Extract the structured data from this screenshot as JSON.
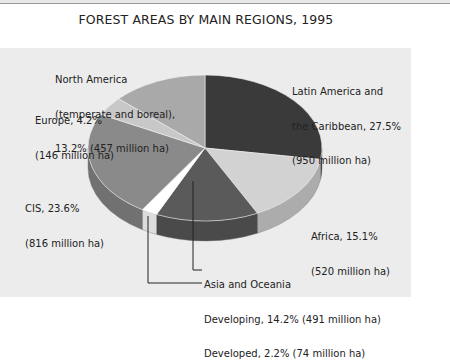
{
  "chart_data": {
    "type": "pie",
    "title": "FOREST AREAS BY MAIN REGIONS, 1995",
    "style": "3d-pie",
    "slices": [
      {
        "name": "Latin America and the Caribbean",
        "percent": 27.5,
        "value": 950,
        "unit": "million ha",
        "color": "#3a3a3a"
      },
      {
        "name": "Africa",
        "percent": 15.1,
        "value": 520,
        "unit": "million ha",
        "color": "#d2d2d2"
      },
      {
        "name": "Asia and Oceania - Developing",
        "percent": 14.2,
        "value": 491,
        "unit": "million ha",
        "color": "#5a5a5a"
      },
      {
        "name": "Asia and Oceania - Developed",
        "percent": 2.2,
        "value": 74,
        "unit": "million ha",
        "color": "#ffffff"
      },
      {
        "name": "CIS",
        "percent": 23.6,
        "value": 816,
        "unit": "million ha",
        "color": "#8a8a8a"
      },
      {
        "name": "Europe",
        "percent": 4.2,
        "value": 146,
        "unit": "million ha",
        "color": "#c8c8c8"
      },
      {
        "name": "North America (temperate and boreal)",
        "percent": 13.2,
        "value": 457,
        "unit": "million ha",
        "color": "#a9a9a9"
      }
    ]
  },
  "labels": {
    "north_america": [
      "North America",
      "(temperate and boreal),",
      "13.2% (457 million ha)"
    ],
    "europe": [
      "Europe, 4.2%",
      "(146 million ha)"
    ],
    "latin_america": [
      "Latin America and",
      "the Caribbean, 27.5%",
      "(950 million ha)"
    ],
    "cis": [
      "CIS, 23.6%",
      "(816 million ha)"
    ],
    "africa": [
      "Africa, 15.1%",
      "(520 million ha)"
    ],
    "asia_header": "Asia and Oceania",
    "asia_developing": "Developing, 14.2% (491 million ha)",
    "asia_developed": "Developed, 2.2% (74 million ha)"
  }
}
